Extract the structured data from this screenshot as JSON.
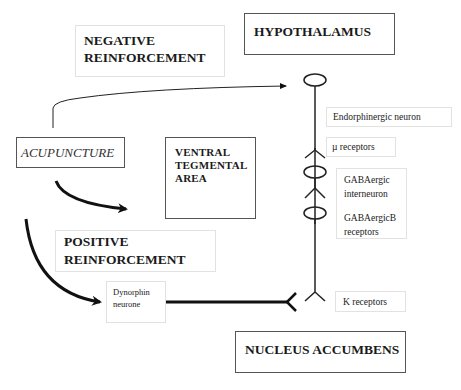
{
  "diagram": {
    "boxes": {
      "negative_reinforcement": {
        "line1": "NEGATIVE",
        "line2": "REINFORCEMENT"
      },
      "hypothalamus": {
        "label": "HYPOTHALAMUS"
      },
      "acupuncture": {
        "label": "ACUPUNCTURE"
      },
      "ventral_tegmental_area": {
        "line1": "VENTRAL",
        "line2": "TEGMENTAL",
        "line3": "AREA"
      },
      "positive_reinforcement": {
        "line1": "POSITIVE",
        "line2": "REINFORCEMENT"
      },
      "dynorphin_neurone": {
        "line1": "Dynorphin",
        "line2": "neurone"
      },
      "nucleus_accumbens": {
        "label": "NUCLEUS ACCUMBENS"
      }
    },
    "labels": {
      "endorphinergic_neuron": "Endorphinergic neuron",
      "mu_receptors": "µ receptors",
      "gabaergic_interneuron": {
        "line1": "GABAergic",
        "line2": "interneuron"
      },
      "gabaergic_b_receptors": {
        "line1": "GABAergicB",
        "line2": "receptors"
      },
      "k_receptors": "K receptors"
    },
    "colors": {
      "line": "#111111",
      "box_border_dark": "#555555",
      "box_border_light": "#e2e2e2"
    }
  }
}
